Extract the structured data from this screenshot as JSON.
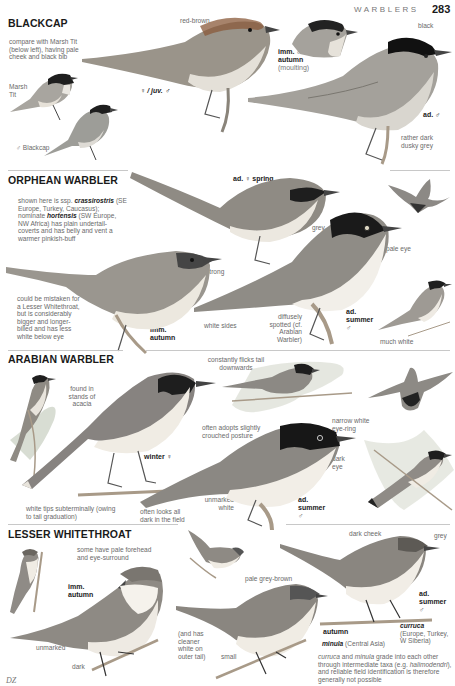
{
  "page": {
    "running_head": "WARBLERS",
    "page_number": "283",
    "artist_initials": "DZ"
  },
  "sections": [
    {
      "title": "BLACKCAP",
      "notes": {
        "compare": "compare with Marsh Tit (below left), having pale cheek and black bib",
        "marsh_tit": "Marsh Tit",
        "male_blackcap": "♂ Blackcap",
        "red_brown": "red-brown",
        "female_juv": "♀ / juv. ♂",
        "imm_label": "imm. ♂",
        "imm_season": "autumn",
        "imm_note": "(moulting)",
        "black": "black",
        "ad_male": "ad. ♂",
        "dusky": "rather dark dusky grey"
      }
    },
    {
      "title": "ORPHEAN WARBLER",
      "notes": {
        "ssp_prefix": "shown here is ssp.",
        "ssp_name": "crassirostris",
        "ssp_range": "(SE Europe, Turkey, Caucasus); nominate",
        "nominate_name": "hortensis",
        "nominate_text": "(SW Europe, NW Africa) has plain undertail-coverts and has belly and vent a warmer pinkish-buff",
        "ad_female_spring": "ad. ♀ spring",
        "grey": "grey",
        "pale_eye": "pale eye",
        "strong": "strong",
        "mistaken": "could be mistaken for a Lesser Whitethroat, but is considerably bigger and longer-billed and has less white below eye",
        "imm_label": "imm.",
        "imm_season": "autumn",
        "white_sides": "white sides",
        "diffusely": "diffusely spotted (cf. Arabian Warbler)",
        "ad_summer": "ad.",
        "ad_summer_season": "summer",
        "ad_summer_sex": "♂",
        "much_white": "much white"
      }
    },
    {
      "title": "ARABIAN WARBLER",
      "notes": {
        "found_in": "found in stands of acacia",
        "constantly": "constantly flicks tail downwards",
        "winter_female": "winter ♀",
        "narrow_white": "narrow white eye-ring",
        "often_adopts": "often adopts slightly crouched posture",
        "dark_eye": "dark eye",
        "white_tips": "white tips subterminally (owing to tail graduation)",
        "often_looks": "often looks all dark in the field",
        "unmarked_white": "unmarked white",
        "ad_summer": "ad.",
        "ad_summer_season": "summer",
        "ad_summer_sex": "♂"
      }
    },
    {
      "title": "LESSER WHITETHROAT",
      "notes": {
        "pale_forehead": "some have pale forehead and eye-surround",
        "imm_label": "imm.",
        "imm_season": "autumn",
        "unmarked": "unmarked",
        "dark": "dark",
        "less_neat": "(and has cleaner white on outer tail)",
        "small": "small",
        "pale_grey_brown": "pale grey-brown",
        "dark_cheek": "dark cheek",
        "grey": "grey",
        "ad_summer": "ad.",
        "ad_summer_season": "summer",
        "ad_summer_sex": "♂",
        "autumn": "autumn",
        "minula_name": "minula",
        "minula_range": "(Central Asia)",
        "curruca_name": "curruca",
        "curruca_range": "(Europe, Turkey, W Siberia)",
        "grade_text_1": "curruca",
        "grade_text_2": "and",
        "grade_text_3": "minula",
        "grade_text_4": "grade into each other through intermediate taxa (e.g.",
        "grade_text_5": "halimodendri",
        "grade_text_6": "), and reliable field identification is therefore generally not possible"
      }
    }
  ],
  "colors": {
    "heading": "#1a1a1a",
    "annotation": "#6a6a6a",
    "divider": "#c8c8c8",
    "bird_grey": "#9a9a9a",
    "bird_dark": "#1f1f1f",
    "bird_belly": "#e8e4de",
    "branch": "#a89a88"
  }
}
